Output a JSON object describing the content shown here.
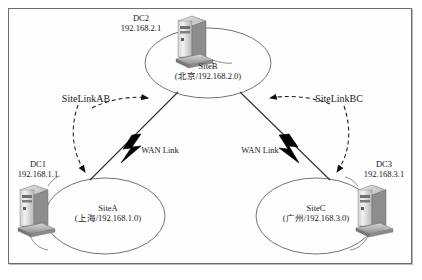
{
  "diagram": {
    "frame": {
      "border_color": "#6e6e6e",
      "background": "#fefefe"
    }
  },
  "sites": [
    {
      "id": "siteB",
      "name": "SiteB",
      "location_subnet": "(北京/192.168.2.0)",
      "dc_name": "DC2",
      "dc_ip": "192.168.2.1",
      "icon": "tower-pc-icon"
    },
    {
      "id": "siteA",
      "name": "SiteA",
      "location_subnet": "(上海/192.168.1.0)",
      "dc_name": "DC1",
      "dc_ip": "192.168.1.1",
      "icon": "tower-pc-icon"
    },
    {
      "id": "siteC",
      "name": "SiteC",
      "location_subnet": "(广州/192.168.3.0)",
      "dc_name": "DC3",
      "dc_ip": "192.168.3.1",
      "icon": "tower-pc-icon"
    }
  ],
  "site_links": [
    {
      "id": "siteLinkAB",
      "label": "SiteLinkAB",
      "from": "SiteA",
      "to": "SiteB",
      "style": "dashed-bidirectional"
    },
    {
      "id": "siteLinkBC",
      "label": "SiteLinkBC",
      "from": "SiteC",
      "to": "SiteB",
      "style": "dashed-bidirectional"
    }
  ],
  "wan_links": [
    {
      "id": "wanLinkAB",
      "label": "WAN Link",
      "icon": "lightning-bolt-icon"
    },
    {
      "id": "wanLinkBC",
      "label": "WAN Link",
      "icon": "lightning-bolt-icon"
    }
  ],
  "colors": {
    "line": "#3a3a3a",
    "ellipse": "#5a5a5a",
    "bolt": "#000000",
    "text": "#1a1a1a"
  }
}
